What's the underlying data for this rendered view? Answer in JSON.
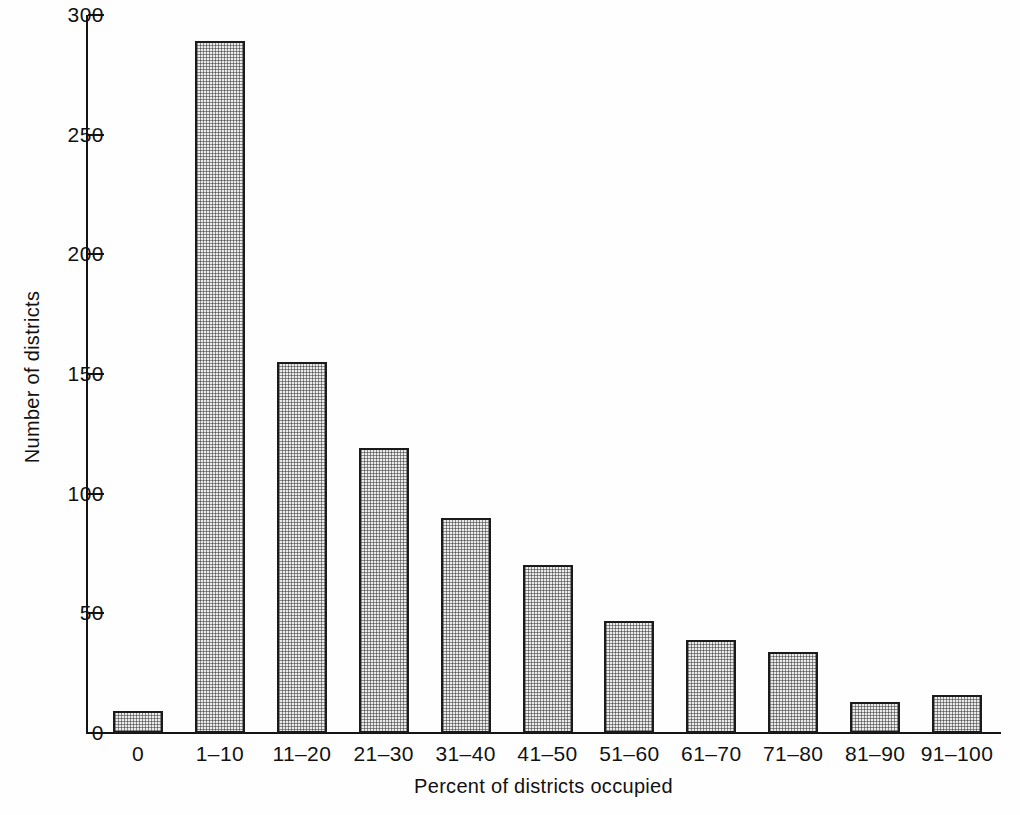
{
  "chart_data": {
    "type": "bar",
    "title": "",
    "subtitle": "",
    "xlabel": "Percent of districts occupied",
    "ylabel": "Number of districts",
    "categories": [
      "0",
      "1–10",
      "11–20",
      "21–30",
      "31–40",
      "41–50",
      "51–60",
      "61–70",
      "71–80",
      "81–90",
      "91–100"
    ],
    "values": [
      9,
      289,
      155,
      119,
      90,
      70,
      47,
      39,
      34,
      13,
      16
    ],
    "series": [
      {
        "name": "Number of districts",
        "values": [
          9,
          289,
          155,
          119,
          90,
          70,
          47,
          39,
          34,
          13,
          16
        ]
      }
    ],
    "ylim": [
      0,
      300
    ],
    "xlim_categories": 11,
    "yticks": [
      0,
      50,
      100,
      150,
      200,
      250,
      300
    ],
    "ytick_labels": [
      "0",
      "50",
      "100",
      "150",
      "200",
      "250",
      "300"
    ],
    "grid": false,
    "legend": false,
    "legend_position": "none",
    "bar_fill": "#ebebeb",
    "bar_edge": "#1b1b1b",
    "bar_pattern": "stipple-dots",
    "axis_color": "#141414",
    "background": "#ffffff"
  }
}
